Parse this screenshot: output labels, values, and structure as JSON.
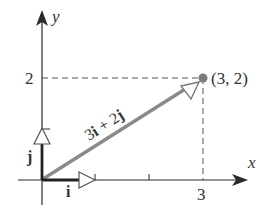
{
  "diagram": {
    "type": "vector-decomposition",
    "axes": {
      "x_label": "x",
      "y_label": "y",
      "x_tick_label": "3",
      "y_tick_label": "2"
    },
    "point": {
      "label": "(3, 2)",
      "x": 3,
      "y": 2
    },
    "vectors": [
      {
        "name": "i",
        "label": "i",
        "components": [
          1,
          0
        ]
      },
      {
        "name": "j",
        "label": "j",
        "components": [
          0,
          1
        ]
      },
      {
        "name": "resultant",
        "label": "3i + 2j",
        "components": [
          3,
          2
        ]
      }
    ],
    "colors": {
      "axis": "#2a2a2a",
      "resultant": "#8a8a8a",
      "dashed": "#555555",
      "point": "#7a7a7a",
      "unit_vector": "#222222"
    }
  }
}
